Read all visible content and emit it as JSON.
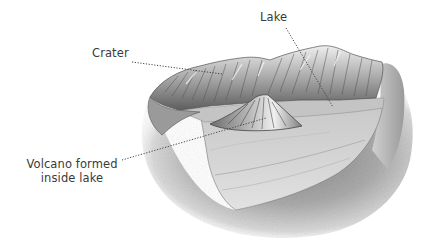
{
  "diagram": {
    "labels": [
      {
        "id": "crater",
        "text": "Crater"
      },
      {
        "id": "lake",
        "text": "Lake"
      },
      {
        "id": "volcano",
        "line1": "Volcano formed",
        "line2": "inside lake"
      }
    ],
    "colors": {
      "text": "#3a3a3a",
      "leader_line": "#444444",
      "lake_surface": "#c9c9c9",
      "rock_dark": "#6a6a6a",
      "rock_light": "#e6e6e6",
      "ground_shadow": "#8a8a8a",
      "background": "#ffffff"
    }
  }
}
